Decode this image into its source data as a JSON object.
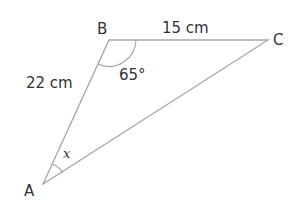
{
  "diagram": {
    "type": "triangle",
    "vertices": [
      {
        "name": "A",
        "label": "A"
      },
      {
        "name": "B",
        "label": "B"
      },
      {
        "name": "C",
        "label": "C"
      }
    ],
    "sides": {
      "AB": "22 cm",
      "BC": "15 cm"
    },
    "angles": {
      "B": "65°",
      "A": "x"
    },
    "colors": {
      "line": "#a6a6a6",
      "text": "#333333",
      "background": "#ffffff"
    }
  }
}
